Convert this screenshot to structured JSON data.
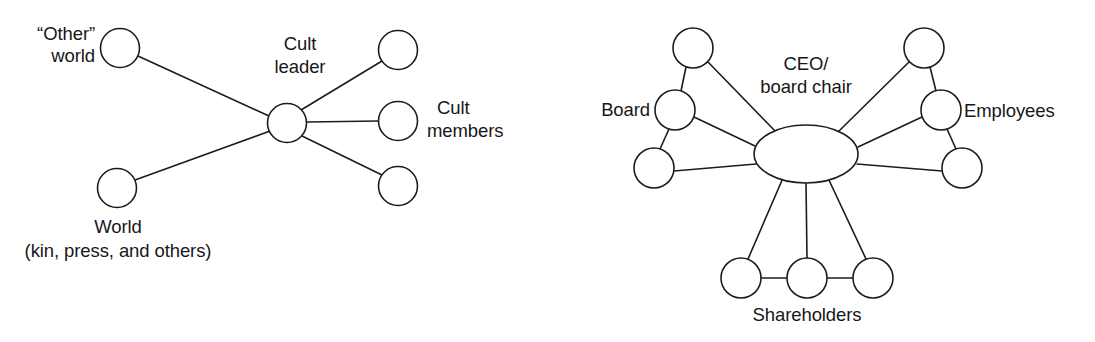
{
  "figure": {
    "background_color": "#ffffff",
    "stroke_color": "#1c1c1c",
    "text_color": "#17171a",
    "width": 1095,
    "height": 342
  },
  "diagrams": [
    {
      "id": "cult-network",
      "name": "Cult leader network",
      "labels": {
        "hub_line1": "Cult",
        "hub_line2": "leader",
        "other_world_line1": "“Other”",
        "other_world_line2": "world",
        "world_line1": "World",
        "world_line2": "(kin, press, and others)",
        "members_line1": "Cult",
        "members_line2": "members"
      },
      "nodes": [
        {
          "id": "cult-leader",
          "name": "cult-leader-node",
          "shape": "circle",
          "cx": 287,
          "cy": 123,
          "r": 19.5
        },
        {
          "id": "other-world",
          "name": "other-world-node",
          "shape": "circle",
          "cx": 120,
          "cy": 48,
          "r": 19.5
        },
        {
          "id": "world",
          "name": "world-node",
          "shape": "circle",
          "cx": 117,
          "cy": 188,
          "r": 19.5
        },
        {
          "id": "member-top",
          "name": "cult-member-node-top",
          "shape": "circle",
          "cx": 398,
          "cy": 50,
          "r": 19.5
        },
        {
          "id": "member-mid",
          "name": "cult-member-node-middle",
          "shape": "circle",
          "cx": 398,
          "cy": 121,
          "r": 19.5
        },
        {
          "id": "member-bottom",
          "name": "cult-member-node-bottom",
          "shape": "circle",
          "cx": 398,
          "cy": 186,
          "r": 19.5
        }
      ],
      "edges": [
        {
          "name": "edge-other-world-to-leader",
          "x1": 138,
          "y1": 56,
          "x2": 269,
          "y2": 116
        },
        {
          "name": "edge-world-to-leader",
          "x1": 135,
          "y1": 180,
          "x2": 270,
          "y2": 131
        },
        {
          "name": "edge-leader-to-member-top",
          "x1": 301,
          "y1": 110,
          "x2": 382,
          "y2": 61
        },
        {
          "name": "edge-leader-to-member-mid",
          "x1": 307,
          "y1": 122,
          "x2": 379,
          "y2": 121
        },
        {
          "name": "edge-leader-to-member-bottom",
          "x1": 302,
          "y1": 136,
          "x2": 382,
          "y2": 175
        }
      ],
      "text_positions": [
        {
          "name": "label-other-world",
          "anchor": "end",
          "x": 95,
          "y": 40,
          "bind": "diagrams.0.labels.other_world_line1"
        },
        {
          "name": "label-other-world",
          "anchor": "end",
          "x": 95,
          "y": 62,
          "bind": "diagrams.0.labels.other_world_line2"
        },
        {
          "name": "label-hub",
          "anchor": "middle",
          "x": 300,
          "y": 50,
          "bind": "diagrams.0.labels.hub_line1"
        },
        {
          "name": "label-hub",
          "anchor": "middle",
          "x": 300,
          "y": 73,
          "bind": "diagrams.0.labels.hub_line2"
        },
        {
          "name": "label-members",
          "anchor": "start",
          "x": 437,
          "y": 114,
          "bind": "diagrams.0.labels.members_line1"
        },
        {
          "name": "label-members",
          "anchor": "start",
          "x": 427,
          "y": 137,
          "bind": "diagrams.0.labels.members_line2"
        },
        {
          "name": "label-world",
          "anchor": "middle",
          "x": 118,
          "y": 233,
          "bind": "diagrams.0.labels.world_line1"
        },
        {
          "name": "label-world",
          "anchor": "middle",
          "x": 118,
          "y": 257,
          "bind": "diagrams.0.labels.world_line2"
        }
      ]
    },
    {
      "id": "corporate-network",
      "name": "CEO / board chair network",
      "labels": {
        "hub_line1": "CEO/",
        "hub_line2": "board chair",
        "board": "Board",
        "employees": "Employees",
        "shareholders": "Shareholders"
      },
      "nodes": [
        {
          "id": "ceo-hub",
          "name": "ceo-board-chair-node",
          "shape": "ellipse",
          "cx": 806,
          "cy": 154,
          "rx": 52,
          "ry": 29
        },
        {
          "id": "board-top",
          "name": "board-node-top",
          "shape": "circle",
          "cx": 693,
          "cy": 48,
          "r": 20
        },
        {
          "id": "board-mid",
          "name": "board-node-middle",
          "shape": "circle",
          "cx": 675,
          "cy": 110,
          "r": 20
        },
        {
          "id": "board-bottom",
          "name": "board-node-bottom",
          "shape": "circle",
          "cx": 654,
          "cy": 168,
          "r": 20
        },
        {
          "id": "employee-top",
          "name": "employee-node-top",
          "shape": "circle",
          "cx": 924,
          "cy": 48,
          "r": 20
        },
        {
          "id": "employee-mid",
          "name": "employee-node-middle",
          "shape": "circle",
          "cx": 941,
          "cy": 110,
          "r": 20
        },
        {
          "id": "employee-bottom",
          "name": "employee-node-bottom",
          "shape": "circle",
          "cx": 962,
          "cy": 168,
          "r": 20
        },
        {
          "id": "shareholder-left",
          "name": "shareholder-node-left",
          "shape": "circle",
          "cx": 741,
          "cy": 278,
          "r": 20
        },
        {
          "id": "shareholder-mid",
          "name": "shareholder-node-middle",
          "shape": "circle",
          "cx": 807,
          "cy": 278,
          "r": 20
        },
        {
          "id": "shareholder-right",
          "name": "shareholder-node-right",
          "shape": "circle",
          "cx": 873,
          "cy": 278,
          "r": 20
        }
      ],
      "edges": [
        {
          "name": "edge-board-top-to-board-mid",
          "x1": 686,
          "y1": 67,
          "x2": 681,
          "y2": 91
        },
        {
          "name": "edge-board-mid-to-board-bottom",
          "x1": 669,
          "y1": 129,
          "x2": 660,
          "y2": 149
        },
        {
          "name": "edge-board-top-to-hub",
          "x1": 708,
          "y1": 62,
          "x2": 777,
          "y2": 133
        },
        {
          "name": "edge-board-mid-to-hub",
          "x1": 694,
          "y1": 117,
          "x2": 755,
          "y2": 146
        },
        {
          "name": "edge-board-bottom-to-hub",
          "x1": 674,
          "y1": 171,
          "x2": 756,
          "y2": 164
        },
        {
          "name": "edge-employee-top-to-employee-mid",
          "x1": 930,
          "y1": 67,
          "x2": 936,
          "y2": 91
        },
        {
          "name": "edge-employee-mid-to-employee-bot",
          "x1": 947,
          "y1": 129,
          "x2": 956,
          "y2": 149
        },
        {
          "name": "edge-employee-top-to-hub",
          "x1": 909,
          "y1": 62,
          "x2": 838,
          "y2": 132
        },
        {
          "name": "edge-employee-mid-to-hub",
          "x1": 922,
          "y1": 117,
          "x2": 858,
          "y2": 147
        },
        {
          "name": "edge-employee-bottom-to-hub",
          "x1": 942,
          "y1": 171,
          "x2": 857,
          "y2": 164
        },
        {
          "name": "edge-hub-to-shareholder-left",
          "x1": 783,
          "y1": 178,
          "x2": 748,
          "y2": 259
        },
        {
          "name": "edge-hub-to-shareholder-mid",
          "x1": 806,
          "y1": 183,
          "x2": 807,
          "y2": 258
        },
        {
          "name": "edge-hub-to-shareholder-right",
          "x1": 828,
          "y1": 178,
          "x2": 866,
          "y2": 259
        },
        {
          "name": "edge-shareholder-left-to-middle",
          "x1": 761,
          "y1": 278,
          "x2": 787,
          "y2": 278
        },
        {
          "name": "edge-shareholder-middle-to-right",
          "x1": 827,
          "y1": 278,
          "x2": 853,
          "y2": 278
        }
      ],
      "text_positions": [
        {
          "name": "label-board",
          "anchor": "end",
          "x": 650,
          "y": 116,
          "bind": "diagrams.1.labels.board"
        },
        {
          "name": "label-hub",
          "anchor": "middle",
          "x": 806,
          "y": 70,
          "bind": "diagrams.1.labels.hub_line1"
        },
        {
          "name": "label-hub",
          "anchor": "middle",
          "x": 806,
          "y": 93,
          "bind": "diagrams.1.labels.hub_line2"
        },
        {
          "name": "label-employees",
          "anchor": "start",
          "x": 964,
          "y": 117,
          "bind": "diagrams.1.labels.employees"
        },
        {
          "name": "label-shareholders",
          "anchor": "middle",
          "x": 807,
          "y": 321,
          "bind": "diagrams.1.labels.shareholders"
        }
      ]
    }
  ]
}
